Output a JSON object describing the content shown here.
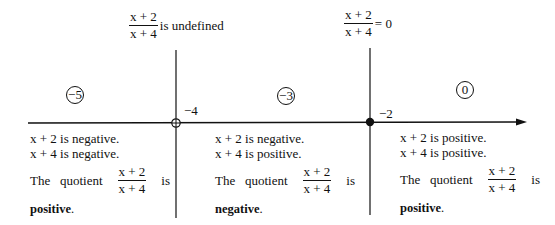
{
  "diagram": {
    "type": "sign-analysis number line",
    "expression": {
      "numerator": "x + 2",
      "denominator": "x + 4"
    },
    "top_labels": [
      {
        "numerator": "x + 2",
        "denominator": "x + 4",
        "text": "is undefined"
      },
      {
        "numerator": "x + 2",
        "denominator": "x + 4",
        "text": "= 0"
      }
    ],
    "critical_points": [
      {
        "label": "−4",
        "marker": "open-circle"
      },
      {
        "label": "−2",
        "marker": "filled-dot"
      }
    ],
    "test_values": [
      "−5",
      "−3",
      "0"
    ],
    "regions": [
      {
        "line1": "x + 2 is negative.",
        "line2": "x + 4 is negative.",
        "quotient_prefix": "The   quotient",
        "numerator": "x + 2",
        "denominator": "x + 4",
        "quotient_suffix": "is",
        "verdict": "positive",
        "period": "."
      },
      {
        "line1": "x + 2 is negative.",
        "line2": "x + 4 is positive.",
        "quotient_prefix": "The   quotient",
        "numerator": "x + 2",
        "denominator": "x + 4",
        "quotient_suffix": "is",
        "verdict": "negative",
        "period": "."
      },
      {
        "line1": "x + 2 is positive.",
        "line2": "x + 4 is positive.",
        "quotient_prefix": "The   quotient",
        "numerator": "x + 2",
        "denominator": "x + 4",
        "quotient_suffix": "is",
        "verdict": "positive",
        "period": "."
      }
    ],
    "colors": {
      "ink": "#111111",
      "background": "#ffffff"
    }
  }
}
